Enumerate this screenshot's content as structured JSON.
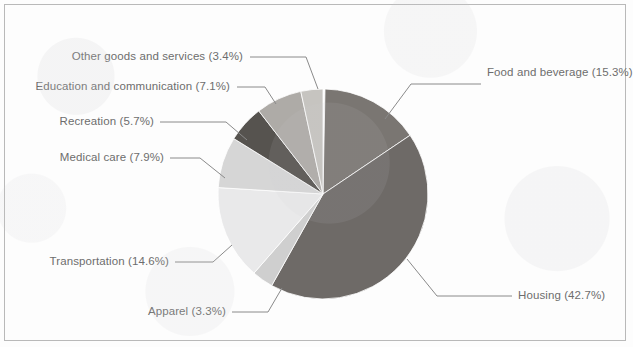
{
  "chart_data": {
    "type": "pie",
    "title": "",
    "subtitle": "",
    "xlabel": "",
    "ylabel": "",
    "legend_position": "none",
    "labels_show_percent": true,
    "start_angle_deg": 0,
    "direction": "clockwise",
    "categories": [
      "Food and beverage",
      "Housing",
      "Apparel",
      "Transportation",
      "Medical care",
      "Recreation",
      "Education and communication",
      "Other goods and services"
    ],
    "values": [
      15.3,
      42.7,
      3.3,
      14.6,
      7.9,
      5.7,
      7.1,
      3.4
    ],
    "total": 100.0,
    "units": "percent",
    "colors": [
      "#7a7672",
      "#6e6a67",
      "#cfcfcf",
      "#e9e9ea",
      "#d6d6d6",
      "#56534f",
      "#aeaba7",
      "#c6c4c0"
    ],
    "slices": [
      {
        "name": "Food and beverage",
        "value": 15.3,
        "label": "Food and beverage (15.3%)",
        "color": "#7a7672",
        "label_side": "right"
      },
      {
        "name": "Housing",
        "value": 42.7,
        "label": "Housing (42.7%)",
        "color": "#6e6a67",
        "label_side": "right"
      },
      {
        "name": "Apparel",
        "value": 3.3,
        "label": "Apparel (3.3%)",
        "color": "#cfcfcf",
        "label_side": "left"
      },
      {
        "name": "Transportation",
        "value": 14.6,
        "label": "Transportation (14.6%)",
        "color": "#e9e9ea",
        "label_side": "left"
      },
      {
        "name": "Medical care",
        "value": 7.9,
        "label": "Medical care (7.9%)",
        "color": "#d6d6d6",
        "label_side": "left"
      },
      {
        "name": "Recreation",
        "value": 5.7,
        "label": "Recreation (5.7%)",
        "color": "#56534f",
        "label_side": "left"
      },
      {
        "name": "Education and communication",
        "value": 7.1,
        "label": "Education and communication (7.1%)",
        "color": "#aeaba7",
        "label_side": "left"
      },
      {
        "name": "Other goods and services",
        "value": 3.4,
        "label": "Other goods and services (3.4%)",
        "color": "#c6c4c0",
        "label_side": "left"
      }
    ]
  },
  "style": {
    "background": "#fdfdfd",
    "border_color": "#b9b9b9",
    "label_color": "#6d6d6d",
    "leader_color": "#8a8a8a"
  }
}
